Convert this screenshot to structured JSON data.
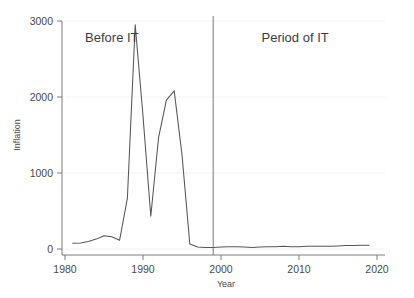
{
  "chart_data": {
    "type": "line",
    "title": "",
    "xlabel": "Year",
    "ylabel": "Inflation",
    "xlim": [
      1980,
      2020
    ],
    "ylim": [
      0,
      3000
    ],
    "xticks": [
      1980,
      1990,
      2000,
      2010,
      2020
    ],
    "yticks": [
      0,
      1000,
      2000,
      3000
    ],
    "xtick_labels": [
      "1980",
      "1990",
      "2000",
      "2010",
      "2020"
    ],
    "ytick_labels": [
      "0",
      "1000",
      "2000",
      "3000"
    ],
    "grid": "horizontal-faint",
    "legend": "none",
    "series": [
      {
        "name": "Inflation",
        "color": "#555555",
        "x": [
          1981,
          1982,
          1983,
          1984,
          1985,
          1986,
          1987,
          1988,
          1989,
          1990,
          1991,
          1992,
          1993,
          1994,
          1995,
          1996,
          1997,
          1998,
          1999,
          2000,
          2001,
          2002,
          2003,
          2004,
          2005,
          2006,
          2007,
          2008,
          2009,
          2010,
          2011,
          2012,
          2013,
          2014,
          2015,
          2016,
          2017,
          2018,
          2019
        ],
        "values": [
          75,
          80,
          100,
          130,
          175,
          160,
          115,
          670,
          2950,
          1750,
          430,
          1470,
          1960,
          2080,
          1240,
          65,
          25,
          20,
          20,
          25,
          30,
          30,
          25,
          20,
          25,
          30,
          30,
          35,
          30,
          30,
          35,
          35,
          35,
          35,
          40,
          45,
          45,
          50,
          50
        ]
      }
    ],
    "annotations": [
      {
        "id": "before-it",
        "text": "Before IT",
        "x": 1986.0,
        "y": 2720,
        "anchor": "middle"
      },
      {
        "id": "period-of-it",
        "text": "Period of IT",
        "x": 2009.5,
        "y": 2720,
        "anchor": "middle"
      }
    ],
    "reference_lines": [
      {
        "id": "it-adoption-divider",
        "orientation": "vertical",
        "x": 1999.0,
        "color": "#6b6b6b"
      }
    ]
  }
}
